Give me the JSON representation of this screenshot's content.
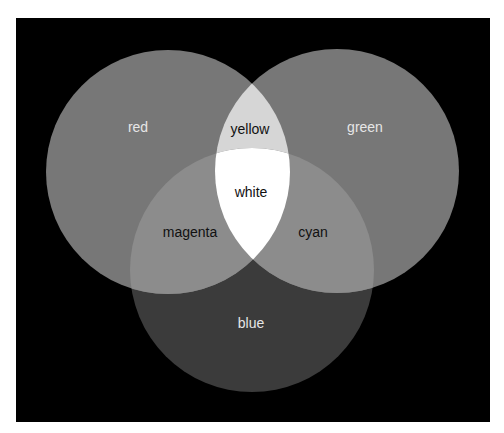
{
  "diagram": {
    "type": "venn-3",
    "background": "#000000",
    "circles": [
      {
        "id": "red",
        "label": "red",
        "cx": 168,
        "cy": 172,
        "r": 122,
        "fill": "#777777",
        "label_color": "#e6e6e6",
        "label_x": 138,
        "label_y": 128
      },
      {
        "id": "green",
        "label": "green",
        "cx": 337,
        "cy": 171,
        "r": 122,
        "fill": "#777777",
        "label_color": "#e6e6e6",
        "label_x": 365,
        "label_y": 128
      },
      {
        "id": "blue",
        "label": "blue",
        "cx": 252,
        "cy": 270,
        "r": 122,
        "fill": "#3b3b3b",
        "label_color": "#e6e6e6",
        "label_x": 251,
        "label_y": 324
      }
    ],
    "intersections": [
      {
        "id": "yellow",
        "label": "yellow",
        "sets": [
          "red",
          "green"
        ],
        "fill": "#d6d6d6",
        "label_color": "#111111",
        "label_x": 250,
        "label_y": 130
      },
      {
        "id": "magenta",
        "label": "magenta",
        "sets": [
          "red",
          "blue"
        ],
        "fill": "#8c8c8c",
        "label_color": "#111111",
        "label_x": 190,
        "label_y": 233
      },
      {
        "id": "cyan",
        "label": "cyan",
        "sets": [
          "green",
          "blue"
        ],
        "fill": "#8c8c8c",
        "label_color": "#111111",
        "label_x": 313,
        "label_y": 233
      },
      {
        "id": "white",
        "label": "white",
        "sets": [
          "red",
          "green",
          "blue"
        ],
        "fill": "#ffffff",
        "label_color": "#111111",
        "label_x": 251,
        "label_y": 193
      }
    ]
  }
}
